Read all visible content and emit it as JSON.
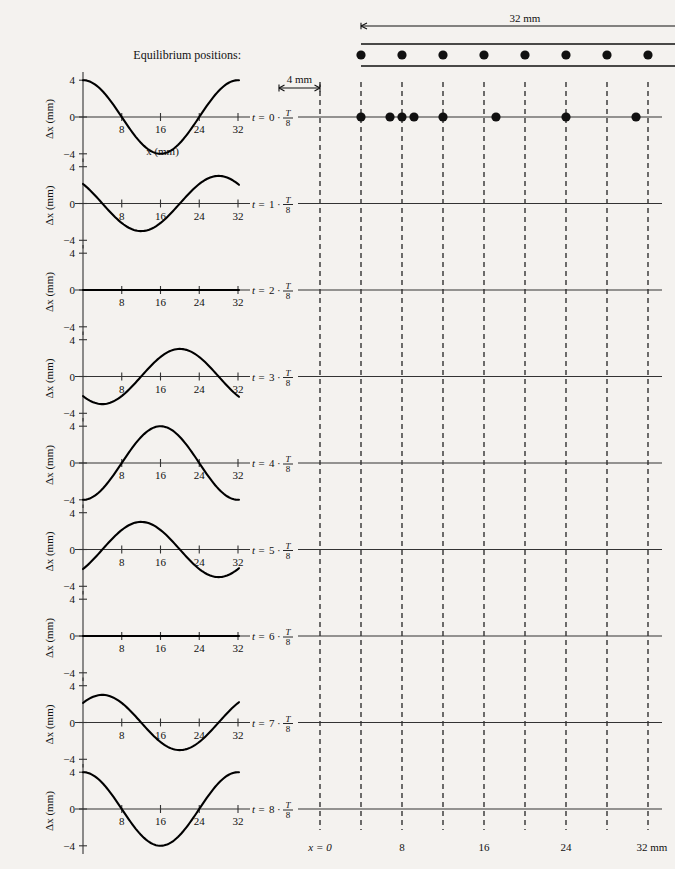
{
  "figure": {
    "title_hidden": "",
    "equilibrium_label": "Equilibrium positions:",
    "span_label": "32 mm",
    "spacing_label": "4 mm",
    "xaxis_label": "x (mm)",
    "yaxis_label": "Δx (mm)",
    "bottom_origin_label": "x = 0",
    "bottom_unit_label": "32 mm",
    "bottom_ticks": [
      "8",
      "16",
      "24"
    ],
    "chart_xticks": [
      "8",
      "16",
      "24",
      "32"
    ],
    "chart_yticks": [
      "4",
      "0",
      "−4"
    ]
  },
  "chart_data": {
    "type": "line",
    "xlabel": "x (mm)",
    "ylabel": "Δx (mm)",
    "xlim": [
      0,
      34
    ],
    "ylim": [
      -5,
      5
    ],
    "grid": false,
    "legend": "none",
    "x_tick_values": [
      8,
      16,
      24,
      32
    ],
    "y_tick_values": [
      4,
      0,
      -4
    ],
    "wavelength_mm": 32,
    "amplitude_mm": 4,
    "equilibrium_positions_mm": [
      0,
      4,
      8,
      12,
      16,
      20,
      24,
      28,
      32
    ],
    "equilibrium_spacing_mm": 4,
    "series": [
      {
        "name": "t = 0 · T/8",
        "time_index": 0,
        "phase_deg": 0,
        "amplitude_mm": 4,
        "form": "A*cos(2*pi*x/32)",
        "values_at_equilibria_mm": [
          4.0,
          2.83,
          0.0,
          -2.83,
          -4.0,
          -2.83,
          0.0,
          2.83,
          4.0
        ],
        "particle_positions_mm": [
          4.0,
          6.83,
          8.0,
          9.17,
          12.0,
          17.17,
          24.0,
          30.83,
          36.0
        ]
      },
      {
        "name": "t = 1 · T/8",
        "time_index": 1,
        "phase_deg": 45,
        "amplitude_mm": 3,
        "form": "A*cos(2*pi*x/32 + pi/4)",
        "values_at_equilibria_mm": [
          2.83,
          0.0,
          -2.83,
          -4.0,
          -2.83,
          0.0,
          2.83,
          4.0,
          2.83
        ]
      },
      {
        "name": "t = 2 · T/8",
        "time_index": 2,
        "phase_deg": 90,
        "amplitude_mm": 0,
        "form": "flat (all displacements zero)",
        "values_at_equilibria_mm": [
          0,
          0,
          0,
          0,
          0,
          0,
          0,
          0,
          0
        ]
      },
      {
        "name": "t = 3 · T/8",
        "time_index": 3,
        "phase_deg": 135,
        "amplitude_mm": 3,
        "form": "-A*cos(2*pi*x/32 + pi/4)",
        "values_at_equilibria_mm": [
          -2.83,
          0.0,
          2.83,
          4.0,
          2.83,
          0.0,
          -2.83,
          -4.0,
          -2.83
        ]
      },
      {
        "name": "t = 4 · T/8",
        "time_index": 4,
        "phase_deg": 180,
        "amplitude_mm": 4,
        "form": "-A*cos(2*pi*x/32)",
        "values_at_equilibria_mm": [
          -4.0,
          -2.83,
          0.0,
          2.83,
          4.0,
          2.83,
          0.0,
          -2.83,
          -4.0
        ]
      },
      {
        "name": "t = 5 · T/8",
        "time_index": 5,
        "phase_deg": 225,
        "amplitude_mm": 3,
        "form": "-A*cos(2*pi*x/32 - pi/4)",
        "values_at_equilibria_mm": [
          -2.83,
          -4.0,
          -2.83,
          0.0,
          2.83,
          4.0,
          2.83,
          0.0,
          -2.83
        ]
      },
      {
        "name": "t = 6 · T/8",
        "time_index": 6,
        "phase_deg": 270,
        "amplitude_mm": 0,
        "form": "flat (all displacements zero)",
        "values_at_equilibria_mm": [
          0,
          0,
          0,
          0,
          0,
          0,
          0,
          0,
          0
        ]
      },
      {
        "name": "t = 7 · T/8",
        "time_index": 7,
        "phase_deg": 315,
        "amplitude_mm": 3,
        "form": "A*cos(2*pi*x/32 - pi/4)",
        "values_at_equilibria_mm": [
          2.83,
          4.0,
          2.83,
          0.0,
          -2.83,
          -4.0,
          -2.83,
          0.0,
          2.83
        ]
      },
      {
        "name": "t = 8 · T/8",
        "time_index": 8,
        "phase_deg": 360,
        "amplitude_mm": 4,
        "form": "A*cos(2*pi*x/32)",
        "values_at_equilibria_mm": [
          4.0,
          2.83,
          0.0,
          -2.83,
          -4.0,
          -2.83,
          0.0,
          2.83,
          4.0
        ]
      }
    ]
  },
  "time_labels": [
    {
      "t": "t =",
      "n": "0",
      "dot": "·",
      "num": "T",
      "den": "8"
    },
    {
      "t": "t =",
      "n": "1",
      "dot": "·",
      "num": "T",
      "den": "8"
    },
    {
      "t": "t =",
      "n": "2",
      "dot": "·",
      "num": "T",
      "den": "8"
    },
    {
      "t": "t =",
      "n": "3",
      "dot": "·",
      "num": "T",
      "den": "8"
    },
    {
      "t": "t =",
      "n": "4",
      "dot": "·",
      "num": "T",
      "den": "8"
    },
    {
      "t": "t =",
      "n": "5",
      "dot": "·",
      "num": "T",
      "den": "8"
    },
    {
      "t": "t =",
      "n": "6",
      "dot": "·",
      "num": "T",
      "den": "8"
    },
    {
      "t": "t =",
      "n": "7",
      "dot": "·",
      "num": "T",
      "den": "8"
    },
    {
      "t": "t =",
      "n": "8",
      "dot": "·",
      "num": "T",
      "den": "8"
    }
  ]
}
